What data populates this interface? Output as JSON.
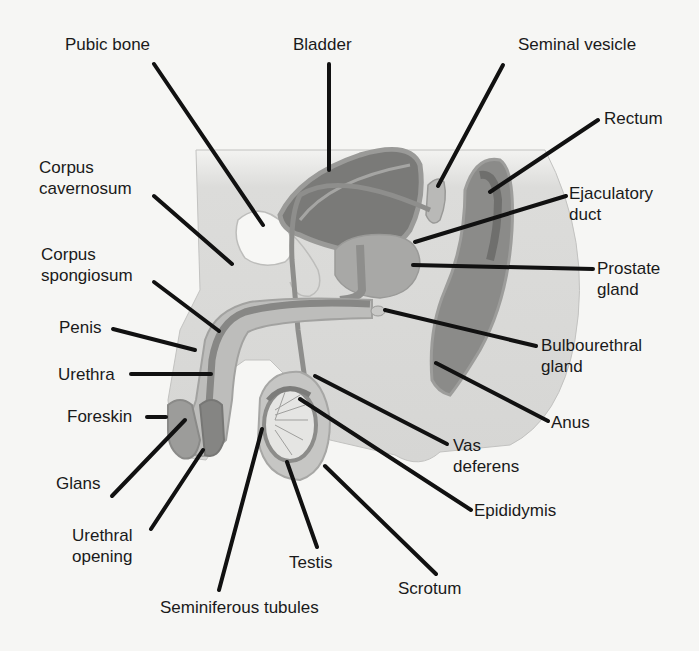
{
  "diagram": {
    "background_color": "#f6f6f4",
    "leader_line_color": "#111111",
    "labels": [
      {
        "id": "pubic-bone",
        "text": "Pubic bone"
      },
      {
        "id": "bladder",
        "text": "Bladder"
      },
      {
        "id": "seminal-vesicle",
        "text": "Seminal vesicle"
      },
      {
        "id": "rectum",
        "text": "Rectum"
      },
      {
        "id": "corpus-cavernosum",
        "text": "Corpus\ncavernosum"
      },
      {
        "id": "ejaculatory-duct",
        "text": "Ejaculatory\nduct"
      },
      {
        "id": "corpus-spongiosum",
        "text": "Corpus\nspongiosum"
      },
      {
        "id": "prostate-gland",
        "text": "Prostate\ngland"
      },
      {
        "id": "penis",
        "text": "Penis"
      },
      {
        "id": "bulbourethral-gland",
        "text": "Bulbourethral\ngland"
      },
      {
        "id": "urethra",
        "text": "Urethra"
      },
      {
        "id": "foreskin",
        "text": "Foreskin"
      },
      {
        "id": "anus",
        "text": "Anus"
      },
      {
        "id": "vas-deferens",
        "text": "Vas\ndeferens"
      },
      {
        "id": "glans",
        "text": "Glans"
      },
      {
        "id": "epididymis",
        "text": "Epididymis"
      },
      {
        "id": "urethral-opening",
        "text": "Urethral\nopening"
      },
      {
        "id": "testis",
        "text": "Testis"
      },
      {
        "id": "scrotum",
        "text": "Scrotum"
      },
      {
        "id": "seminiferous-tubules",
        "text": "Seminiferous tubules"
      }
    ]
  }
}
